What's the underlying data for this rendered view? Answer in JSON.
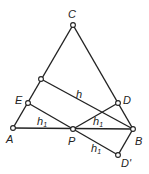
{
  "diagram": {
    "points": {
      "C": {
        "label": "C",
        "x": 73,
        "y": 25
      },
      "F": {
        "label": "",
        "x": 41,
        "y": 79
      },
      "E": {
        "label": "E",
        "x": 28,
        "y": 103
      },
      "A": {
        "label": "A",
        "x": 13,
        "y": 128
      },
      "P": {
        "label": "P",
        "x": 73,
        "y": 129
      },
      "B": {
        "label": "B",
        "x": 133,
        "y": 129
      },
      "D": {
        "label": "D",
        "x": 118,
        "y": 103
      },
      "Dp": {
        "label": "D'",
        "x": 118,
        "y": 155
      }
    },
    "segment_labels": {
      "h": "h",
      "h1_left": "h",
      "h1_left_sub": "1",
      "h1_right": "h",
      "h1_right_sub": "1",
      "h1_lower": "h",
      "h1_lower_sub": "1"
    }
  }
}
